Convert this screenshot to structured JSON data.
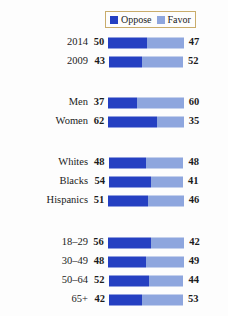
{
  "colors": {
    "oppose": "#2540c2",
    "favor": "#8ea6de",
    "background": "#fdfdfd",
    "legend_border": "#c9ac6b",
    "text": "#1b1b1b"
  },
  "legend": {
    "position": "top-right",
    "entries": [
      {
        "label": "Oppose",
        "color": "#2540c2",
        "swatch_name": "legend-swatch-oppose"
      },
      {
        "label": "Favor",
        "color": "#8ea6de",
        "swatch_name": "legend-swatch-favor"
      }
    ]
  },
  "chart_data": {
    "type": "bar",
    "title": "",
    "subtitle": "",
    "xlabel": "",
    "ylabel": "",
    "orientation": "horizontal",
    "stacked": true,
    "centered_stacks": true,
    "grid": false,
    "legend_position": "top-right",
    "series": [
      {
        "name": "Oppose",
        "color": "#2540c2"
      },
      {
        "name": "Favor",
        "color": "#8ea6de"
      }
    ],
    "groups": [
      {
        "name": "year",
        "rows": [
          {
            "category": "2014",
            "oppose": 50,
            "favor": 47
          },
          {
            "category": "2009",
            "oppose": 43,
            "favor": 52
          }
        ]
      },
      {
        "name": "gender",
        "rows": [
          {
            "category": "Men",
            "oppose": 37,
            "favor": 60
          },
          {
            "category": "Women",
            "oppose": 62,
            "favor": 35
          }
        ]
      },
      {
        "name": "race",
        "rows": [
          {
            "category": "Whites",
            "oppose": 48,
            "favor": 48
          },
          {
            "category": "Blacks",
            "oppose": 54,
            "favor": 41
          },
          {
            "category": "Hispanics",
            "oppose": 51,
            "favor": 46
          }
        ]
      },
      {
        "name": "age",
        "rows": [
          {
            "category": "18–29",
            "oppose": 56,
            "favor": 42
          },
          {
            "category": "30–49",
            "oppose": 48,
            "favor": 49
          },
          {
            "category": "50–64",
            "oppose": 52,
            "favor": 44
          },
          {
            "category": "65+",
            "oppose": 42,
            "favor": 53
          }
        ]
      }
    ]
  },
  "layout": {
    "group_tops": [
      33,
      93,
      153,
      233
    ],
    "row_height": 19,
    "bar_center_x": 146,
    "px_per_unit": 0.78,
    "bar_height": 11
  }
}
